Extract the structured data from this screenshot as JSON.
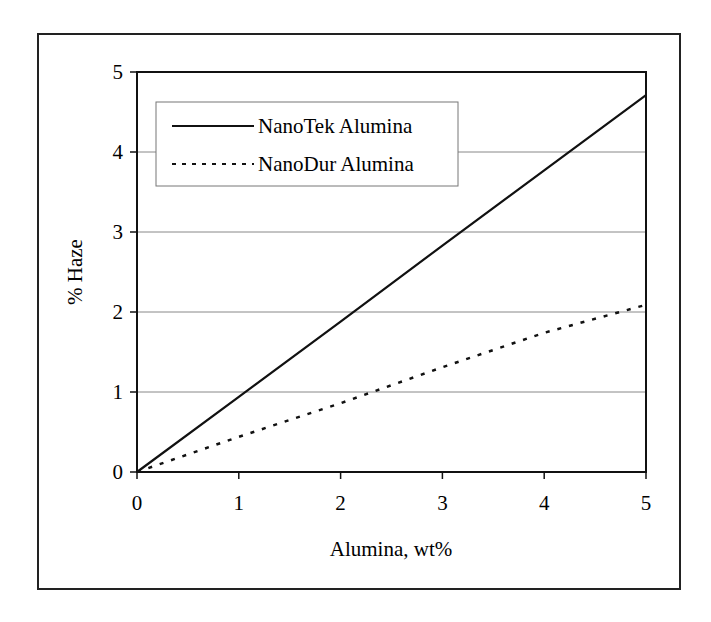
{
  "chart_data": {
    "type": "line",
    "title": "",
    "xlabel": "Alumina, wt%",
    "ylabel": "% Haze",
    "xlim": [
      0,
      5
    ],
    "ylim": [
      0,
      5
    ],
    "xticks": [
      "0",
      "1",
      "2",
      "3",
      "4",
      "5"
    ],
    "yticks": [
      "0",
      "1",
      "2",
      "3",
      "4",
      "5"
    ],
    "grid": {
      "horizontal": true,
      "vertical": false
    },
    "legend_position": "upper-left inside",
    "x": [
      0,
      1,
      2,
      3,
      4,
      5
    ],
    "series": [
      {
        "name": "NanoTek Alumina",
        "style": "solid",
        "values": [
          0,
          0.94,
          1.88,
          2.83,
          3.77,
          4.71
        ]
      },
      {
        "name": "NanoDur Alumina",
        "style": "dotted",
        "values": [
          0,
          0.44,
          0.86,
          1.31,
          1.74,
          2.09
        ]
      }
    ]
  },
  "legend": {
    "items": [
      {
        "label": "NanoTek Alumina"
      },
      {
        "label": "NanoDur Alumina"
      }
    ]
  },
  "axes": {
    "x_title": "Alumina, wt%",
    "y_title": "% Haze"
  },
  "colors": {
    "line": "#111111",
    "grid": "#888888",
    "frame": "#222222"
  }
}
